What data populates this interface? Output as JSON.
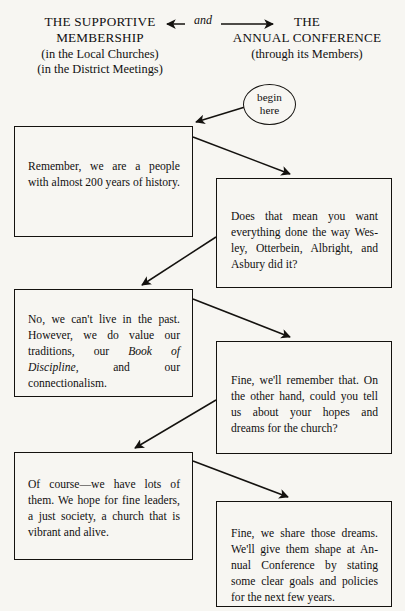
{
  "header": {
    "left": {
      "line1": "THE SUPPORTIVE",
      "line2": "MEMBERSHIP",
      "line3": "(in the Local Churches)",
      "line4": "(in the District Meetings)"
    },
    "right": {
      "line1": "THE",
      "line2": "ANNUAL CONFERENCE",
      "line3": "(through its Members)"
    },
    "connector_label": "and",
    "connector_style": "double-headed-arrow"
  },
  "start_node": {
    "line1": "begin",
    "line2": "here",
    "shape": "ellipse"
  },
  "boxes": [
    {
      "id": "box1",
      "column": "left",
      "speaker": "membership",
      "text": "Remember, we are a people with almost 200 years of history."
    },
    {
      "id": "box2",
      "column": "right",
      "speaker": "annual-conference",
      "text": "Does that mean you want everything done the way Wes-ley, Otterbein, Albright, and Asbury did it?"
    },
    {
      "id": "box3",
      "column": "left",
      "speaker": "membership",
      "text_part1": "No, we can't live in the past. However, we do value our traditions, our ",
      "text_italic": "Book of Discipline,",
      "text_part2": " and our connectionalism."
    },
    {
      "id": "box4",
      "column": "right",
      "speaker": "annual-conference",
      "text": "Fine, we'll remember that. On the other hand, could you tell us about your hopes and dreams for the church?"
    },
    {
      "id": "box5",
      "column": "left",
      "speaker": "membership",
      "text": "Of course—we have lots of them. We hope for fine leaders, a just society, a church that is vibrant and alive."
    },
    {
      "id": "box6",
      "column": "right",
      "speaker": "annual-conference",
      "text": "Fine, we share those dreams. We'll give them shape at An-nual Conference by stating some clear goals and policies for the next few years."
    }
  ],
  "colors": {
    "ink": "#14120f",
    "page": "#f7f6f2"
  }
}
